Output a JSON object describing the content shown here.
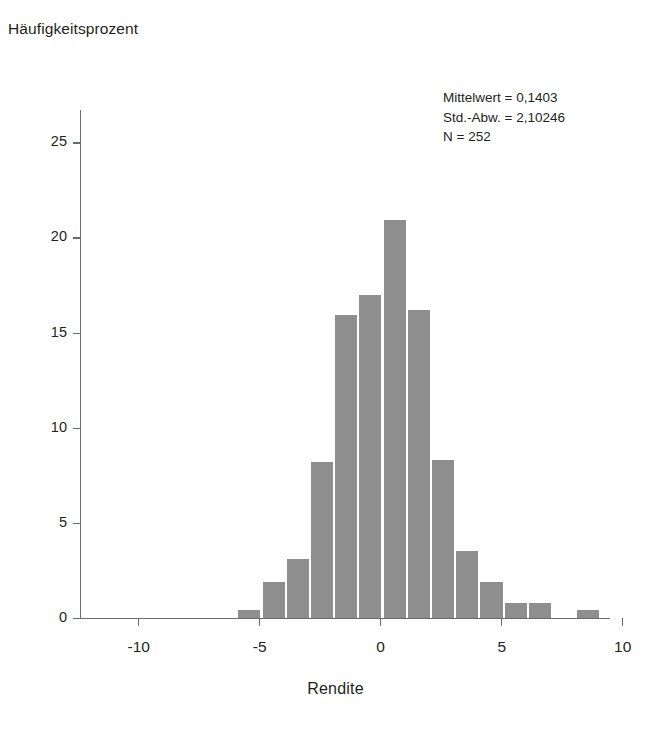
{
  "chart_data": {
    "type": "bar",
    "title": "",
    "subtitle": "",
    "xlabel": "Rendite",
    "ylabel": "Häufigkeitsprozent",
    "xlim": [
      -12.4,
      9.5
    ],
    "ylim": [
      0,
      26.7
    ],
    "grid": false,
    "legend": null,
    "bin_width": 1,
    "x_ticks": [
      {
        "value": -10,
        "label": "-10"
      },
      {
        "value": -5,
        "label": "-5"
      },
      {
        "value": 0,
        "label": "0"
      },
      {
        "value": 5,
        "label": "5"
      },
      {
        "value": 10,
        "label": "10"
      }
    ],
    "y_ticks": [
      {
        "value": 0,
        "label": "0"
      },
      {
        "value": 5,
        "label": "5"
      },
      {
        "value": 10,
        "label": "10"
      },
      {
        "value": 15,
        "label": "15"
      },
      {
        "value": 20,
        "label": "20"
      },
      {
        "value": 25,
        "label": "25"
      }
    ],
    "bar_color": "#8e8e8e",
    "axis_color": "#6b6b6b",
    "bins": [
      {
        "x0": -5.9,
        "x1": -4.9,
        "center": -5.4,
        "value": 0.4
      },
      {
        "x0": -4.9,
        "x1": -3.9,
        "center": -4.4,
        "value": 1.9
      },
      {
        "x0": -3.9,
        "x1": -2.9,
        "center": -3.4,
        "value": 3.1
      },
      {
        "x0": -2.9,
        "x1": -1.9,
        "center": -2.4,
        "value": 8.2
      },
      {
        "x0": -1.9,
        "x1": -0.9,
        "center": -1.4,
        "value": 15.9
      },
      {
        "x0": -0.9,
        "x1": 0.1,
        "center": -0.4,
        "value": 17.0
      },
      {
        "x0": 0.1,
        "x1": 1.1,
        "center": 0.6,
        "value": 20.9
      },
      {
        "x0": 1.1,
        "x1": 2.1,
        "center": 1.6,
        "value": 16.2
      },
      {
        "x0": 2.1,
        "x1": 3.1,
        "center": 2.6,
        "value": 8.3
      },
      {
        "x0": 3.1,
        "x1": 4.1,
        "center": 3.6,
        "value": 3.5
      },
      {
        "x0": 4.1,
        "x1": 5.1,
        "center": 4.6,
        "value": 1.9
      },
      {
        "x0": 5.1,
        "x1": 6.1,
        "center": 5.6,
        "value": 0.8
      },
      {
        "x0": 6.1,
        "x1": 7.1,
        "center": 6.6,
        "value": 0.8
      },
      {
        "x0": 8.1,
        "x1": 9.1,
        "center": 8.6,
        "value": 0.4
      }
    ],
    "annotations": {
      "mean_label": "Mittelwert = 0,1403",
      "std_label": "Std.-Abw. = 2,10246",
      "n_label": "N = 252",
      "mean_value": 0.1403,
      "std_value": 2.10246,
      "n_value": 252
    }
  }
}
